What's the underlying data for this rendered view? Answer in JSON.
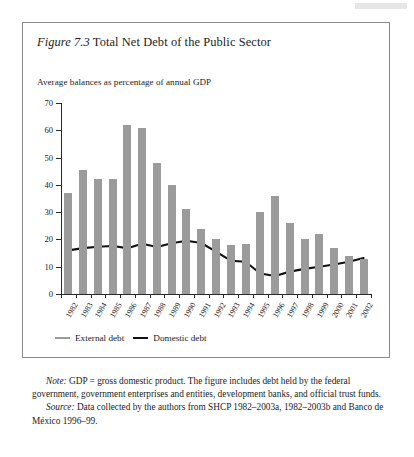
{
  "figure": {
    "number": "Figure 7.3",
    "title": "Total Net Debt of the Public Sector",
    "subtitle": "Average balances as percentage of annual GDP"
  },
  "legend": {
    "external_label": "External debt",
    "domestic_label": "Domestic debt",
    "external_color": "#9b9b9b",
    "domestic_color": "#111111"
  },
  "notes": {
    "note_label": "Note:",
    "note_text": " GDP = gross domestic product. The figure includes debt held by the federal government, government enterprises and entities, development banks, and official trust funds.",
    "source_label": "Source:",
    "source_text": " Data collected by the authors from SHCP 1982–2003a, 1982–2003b and Banco de México 1996–99."
  },
  "chart_data": {
    "type": "bar",
    "title": "Total Net Debt of the Public Sector",
    "subtitle": "Average balances as percentage of annual GDP",
    "xlabel": "",
    "ylabel": "",
    "ylim": [
      0,
      70
    ],
    "yticks": [
      0,
      10,
      20,
      30,
      40,
      50,
      60,
      70
    ],
    "grid": false,
    "legend_position": "below-axis-left",
    "categories": [
      "1982",
      "1983",
      "1984",
      "1985",
      "1986",
      "1987",
      "1988",
      "1989",
      "1990",
      "1991",
      "1992",
      "1993",
      "1994",
      "1995",
      "1996",
      "1997",
      "1998",
      "1999",
      "2000",
      "2001",
      "2002"
    ],
    "series": [
      {
        "name": "External debt",
        "type": "bar",
        "color": "#9b9b9b",
        "values": [
          37,
          45.5,
          42,
          42,
          62,
          61,
          48,
          40,
          31,
          24,
          20,
          18,
          18.5,
          30,
          36,
          26,
          20,
          22,
          17,
          14,
          13
        ]
      },
      {
        "name": "Domestic debt",
        "type": "line",
        "color": "#111111",
        "values": [
          16,
          16.8,
          17.3,
          17.6,
          16.8,
          18.4,
          17.2,
          18.6,
          19.5,
          18.7,
          15.5,
          12.2,
          11.8,
          7.5,
          6.6,
          8.2,
          9.2,
          10.0,
          10.8,
          11.8,
          13.2
        ]
      }
    ]
  }
}
